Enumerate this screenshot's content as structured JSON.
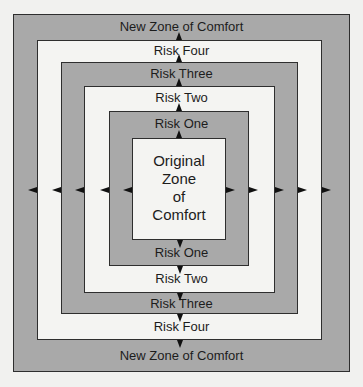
{
  "diagram": {
    "colors": {
      "background": "#f1f1ef",
      "gray_fill": "#a9a9a9",
      "white_fill": "#f4f4f2",
      "border": "#2e2e2e",
      "arrow": "#111111"
    },
    "center": {
      "lines": [
        "Original",
        "Zone",
        "of",
        "Comfort"
      ]
    },
    "rings": [
      {
        "name": "New Zone of Comfort",
        "fill": "gray"
      },
      {
        "name": "Risk Four",
        "fill": "white"
      },
      {
        "name": "Risk Three",
        "fill": "gray"
      },
      {
        "name": "Risk Two",
        "fill": "white"
      },
      {
        "name": "Risk One",
        "fill": "gray"
      },
      {
        "name": "Original Zone of Comfort",
        "fill": "white"
      }
    ],
    "top_labels": [
      "New Zone of Comfort",
      "Risk Four",
      "Risk Three",
      "Risk Two",
      "Risk One"
    ],
    "bottom_labels": [
      "Risk One",
      "Risk Two",
      "Risk Three",
      "Risk Four",
      "New Zone of Comfort"
    ]
  }
}
